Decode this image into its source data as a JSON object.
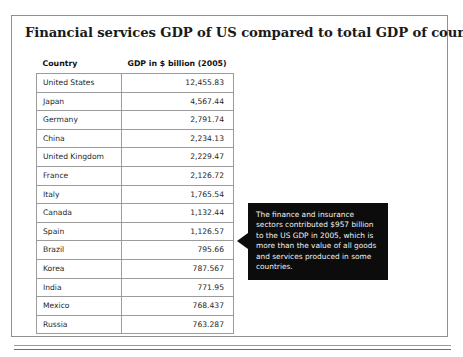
{
  "slide": {
    "title": "Financial services GDP of US compared to total GDP of countries"
  },
  "table": {
    "columns": [
      "Country",
      "GDP in $ billion (2005)"
    ],
    "rows": [
      {
        "country": "United States",
        "gdp": "12,455.83"
      },
      {
        "country": "Japan",
        "gdp": "4,567.44"
      },
      {
        "country": "Germany",
        "gdp": "2,791.74"
      },
      {
        "country": "China",
        "gdp": "2,234.13"
      },
      {
        "country": "United Kingdom",
        "gdp": "2,229.47"
      },
      {
        "country": "France",
        "gdp": "2,126.72"
      },
      {
        "country": "Italy",
        "gdp": "1,765.54"
      },
      {
        "country": "Canada",
        "gdp": "1,132.44"
      },
      {
        "country": "Spain",
        "gdp": "1,126.57"
      },
      {
        "country": "Brazil",
        "gdp": "795.66"
      },
      {
        "country": "Korea",
        "gdp": "787.567"
      },
      {
        "country": "India",
        "gdp": "771.95"
      },
      {
        "country": "Mexico",
        "gdp": "768.437"
      },
      {
        "country": "Russia",
        "gdp": "763.287"
      }
    ]
  },
  "callout": {
    "text": "The finance and insurance sectors contributed $957 billion to the US GDP in 2005, which is more than the value of all goods and services produced in some countries."
  },
  "chart_data": {
    "type": "table",
    "title": "Financial services GDP of US compared to total GDP of countries",
    "columns": [
      "Country",
      "GDP in $ billion (2005)"
    ],
    "xlabel": "Country",
    "ylabel": "GDP in $ billion (2005)",
    "categories": [
      "United States",
      "Japan",
      "Germany",
      "China",
      "United Kingdom",
      "France",
      "Italy",
      "Canada",
      "Spain",
      "Brazil",
      "Korea",
      "India",
      "Mexico",
      "Russia"
    ],
    "values": [
      12455.83,
      4567.44,
      2791.74,
      2234.13,
      2229.47,
      2126.72,
      1765.54,
      1132.44,
      1126.57,
      795.66,
      787.567,
      771.95,
      768.437,
      763.287
    ],
    "annotations": [
      "The finance and insurance sectors contributed $957 billion to the US GDP in 2005, which is more than the value of all goods and services produced in some countries."
    ]
  },
  "colors": {
    "frame_border": "#8f8f8f",
    "table_border": "#9b9b9b",
    "callout_background": "#0c0c0c",
    "callout_text": "#f2f2f2",
    "page_background": "#ffffff"
  }
}
